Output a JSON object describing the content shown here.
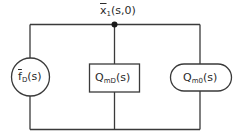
{
  "diagram": {
    "node_label": {
      "base": "x",
      "bar": true,
      "subscript": "1",
      "args": "(s,0)"
    },
    "elements": [
      {
        "shape": "circle",
        "base": "f",
        "bar": true,
        "subscript": "D",
        "args": "(s)"
      },
      {
        "shape": "rectangle",
        "base": "Q",
        "bar": false,
        "subscript": "mD",
        "args": "(s)"
      },
      {
        "shape": "rounded-rectangle",
        "base": "Q",
        "bar": false,
        "subscript": "m0",
        "args": "(s)"
      }
    ],
    "colors": {
      "line": "#3a3a3a",
      "background": "#ffffff"
    }
  }
}
